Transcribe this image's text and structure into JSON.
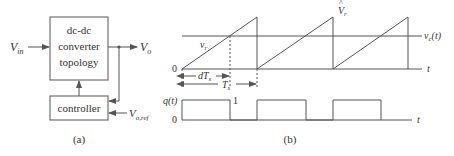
{
  "panel_a": {
    "caption": "(a)",
    "converter_block": {
      "line1": "dc-dc",
      "line2": "converter",
      "line3": "topology"
    },
    "controller_block": {
      "label": "controller"
    },
    "input_label": {
      "main": "V",
      "sub": "in"
    },
    "output_label": {
      "main": "V",
      "sub": "o"
    },
    "reference_label": {
      "main": "V",
      "sub": "o,ref"
    }
  },
  "panel_b": {
    "caption": "(b)",
    "ramp_label": {
      "main": "v",
      "sub": "r"
    },
    "peak_label": {
      "main": "V",
      "sub": "r",
      "accent": "^"
    },
    "control_label": {
      "main": "v",
      "sub": "c",
      "suffix": "(t)"
    },
    "time_axis_label": "t",
    "origin_label": "0",
    "duty_interval": {
      "main": "dT",
      "sub": "s"
    },
    "period_interval": {
      "main": "T",
      "sub": "s"
    },
    "switch_signal": {
      "label": "q(t)",
      "high_value": "1",
      "low_value": "0",
      "time_label": "t"
    }
  },
  "colors": {
    "line": "#555555",
    "text": "#333333",
    "background": "#ffffff"
  }
}
